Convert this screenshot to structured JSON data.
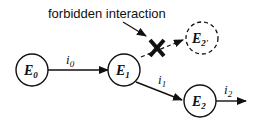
{
  "annotation": {
    "text": "forbidden interaction"
  },
  "nodes": [
    {
      "id": "E0",
      "base": "E",
      "sub": "0",
      "style": "solid"
    },
    {
      "id": "E1",
      "base": "E",
      "sub": "1",
      "style": "solid"
    },
    {
      "id": "E2",
      "base": "E",
      "sub": "2",
      "style": "solid"
    },
    {
      "id": "E2prime",
      "base": "E",
      "sub": "2'",
      "style": "dashed"
    }
  ],
  "edges": [
    {
      "from": "E0",
      "to": "E1",
      "label_base": "i",
      "label_sub": "0"
    },
    {
      "from": "E1",
      "to": "E2",
      "label_base": "i",
      "label_sub": "1"
    },
    {
      "from": "E2",
      "to": "out",
      "label_base": "i",
      "label_sub": "2"
    },
    {
      "from": "E1",
      "to": "E2prime",
      "label_base": "",
      "label_sub": "",
      "forbidden": true
    }
  ],
  "colors": {
    "ink": "#111111",
    "background": "#ffffff"
  }
}
